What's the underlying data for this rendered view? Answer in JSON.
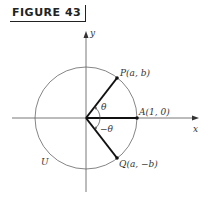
{
  "figure": {
    "label": "FIGURE 43"
  },
  "diagram": {
    "axes": {
      "x_label": "x",
      "y_label": "y"
    },
    "circle_label": "U",
    "points": {
      "P": "P(a, b)",
      "A": "A(1, 0)",
      "Q": "Q(a, −b)"
    },
    "angles": {
      "theta": "θ",
      "neg_theta": "−θ"
    }
  }
}
